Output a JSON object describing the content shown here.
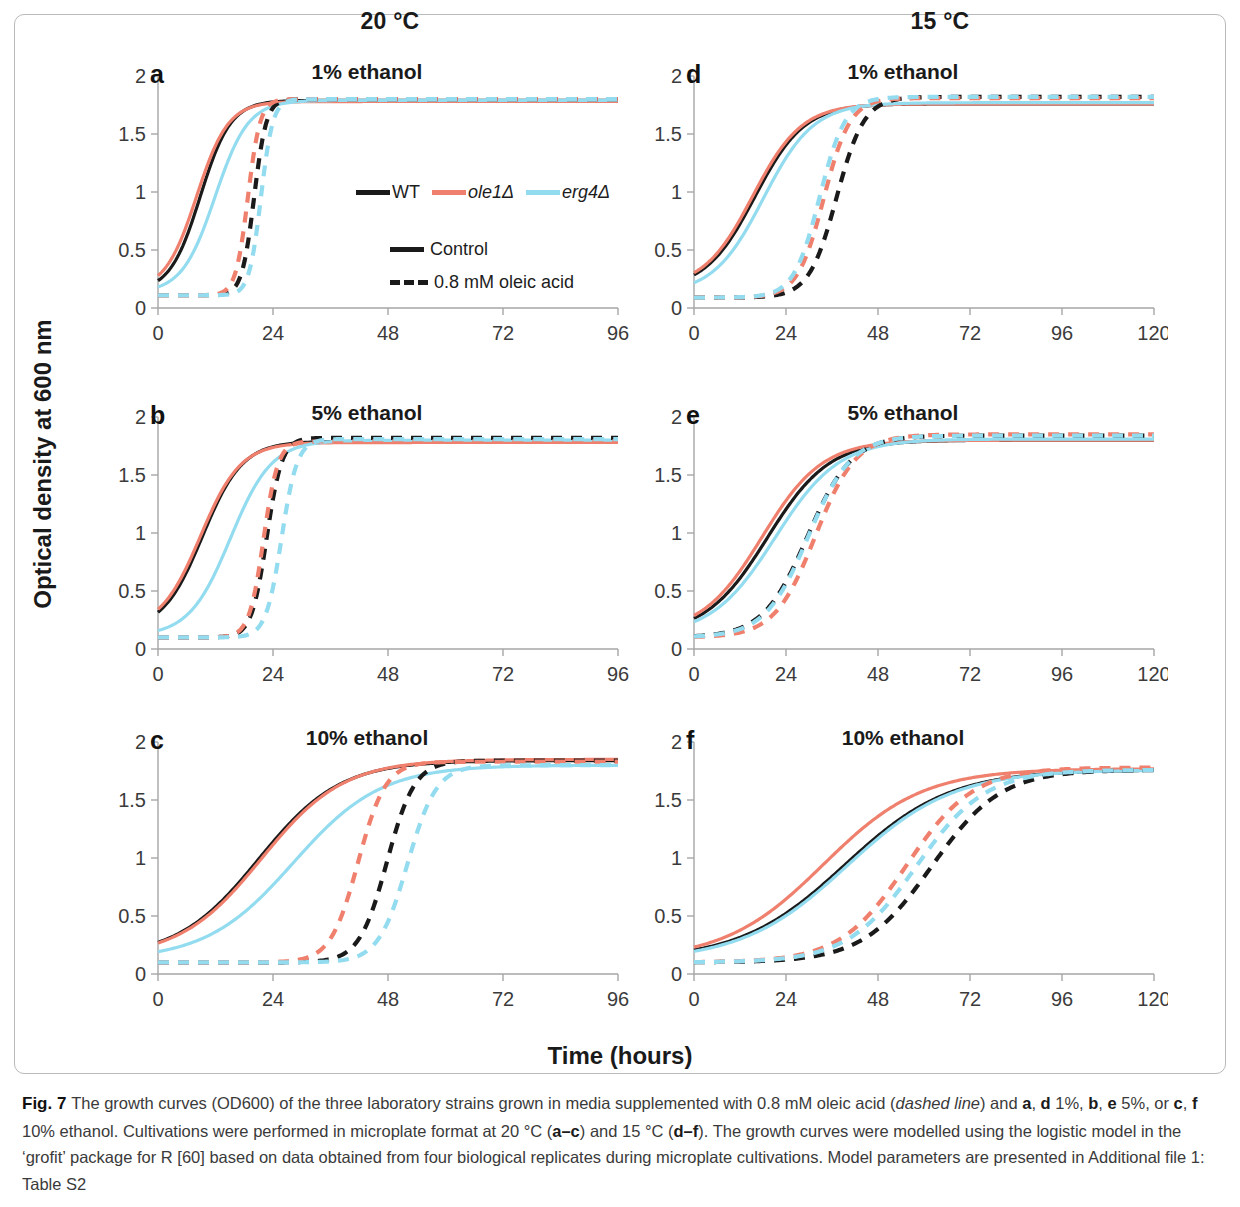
{
  "figure": {
    "number_label": "Fig. 7",
    "columns": [
      {
        "id": "col-20",
        "temperature": "20 °C"
      },
      {
        "id": "col-15",
        "temperature": "15 °C"
      }
    ],
    "axis_titles": {
      "y": "Optical density at 600 nm",
      "x": "Time (hours)"
    }
  },
  "legend": {
    "strains": [
      {
        "name": "WT",
        "color": "#1a1a1a",
        "italic": false
      },
      {
        "name": "ole1Δ",
        "color": "#f0806e",
        "italic": true
      },
      {
        "name": "erg4Δ",
        "color": "#93dcf0",
        "italic": true
      }
    ],
    "styles": [
      {
        "label": "Control",
        "dash": false
      },
      {
        "label": "0.8 mM oleic acid",
        "dash": true
      }
    ]
  },
  "caption": {
    "prefix": "Fig. 7",
    "text_parts": [
      {
        "t": "The growth curves (OD600) of the three laboratory strains grown in media supplemented with 0.8 mM oleic acid (",
        "style": "normal"
      },
      {
        "t": "dashed line",
        "style": "italic"
      },
      {
        "t": ") and ",
        "style": "normal"
      },
      {
        "t": "a",
        "style": "bold"
      },
      {
        "t": ", ",
        "style": "normal"
      },
      {
        "t": "d",
        "style": "bold"
      },
      {
        "t": " 1%, ",
        "style": "normal"
      },
      {
        "t": "b",
        "style": "bold"
      },
      {
        "t": ", ",
        "style": "normal"
      },
      {
        "t": "e",
        "style": "bold"
      },
      {
        "t": " 5%, or ",
        "style": "normal"
      },
      {
        "t": "c",
        "style": "bold"
      },
      {
        "t": ", ",
        "style": "normal"
      },
      {
        "t": "f",
        "style": "bold"
      },
      {
        "t": " 10% ethanol. Cultivations were performed in microplate format at 20 °C (",
        "style": "normal"
      },
      {
        "t": "a–c",
        "style": "bold"
      },
      {
        "t": ") and 15 °C (",
        "style": "normal"
      },
      {
        "t": "d–f",
        "style": "bold"
      },
      {
        "t": "). The growth curves were modelled using the logistic model in the ‘grofit’ package for R [60] based on data obtained from four biological replicates during microplate cultivations. Model parameters are presented in Additional file 1: Table S2",
        "style": "normal"
      }
    ]
  },
  "chart_data": {
    "type": "line",
    "xlabel": "Time (hours)",
    "ylabel": "Optical density at 600 nm",
    "ylim": [
      0,
      2
    ],
    "yticks": [
      0,
      0.5,
      1,
      1.5,
      2
    ],
    "ytick_labels": [
      "0",
      "0.5",
      "1",
      "1.5",
      "2"
    ],
    "grid": false,
    "legend_position": "inside-panel-a",
    "model": "logistic: y = y0 + (A - y0) / (1 + exp(4*mu/(A-y0)*(lambda - t) + 2))",
    "panels": [
      {
        "letter": "a",
        "title": "1% ethanol",
        "temperature": "20 °C",
        "ethanol": "1%",
        "xlim": [
          0,
          96
        ],
        "xticks": [
          0,
          24,
          48,
          72,
          96
        ],
        "xtick_labels": [
          "0",
          "24",
          "48",
          "72",
          "96"
        ],
        "series": [
          {
            "name": "WT Control",
            "strain": "WT",
            "treatment": "Control",
            "color": "#1a1a1a",
            "dash": false,
            "y0": 0.14,
            "A": 1.79,
            "mu": 0.13,
            "lambda": 2.5
          },
          {
            "name": "ole1Δ Control",
            "strain": "ole1Δ",
            "treatment": "Control",
            "color": "#f0806e",
            "dash": false,
            "y0": 0.15,
            "A": 1.78,
            "mu": 0.124,
            "lambda": 1.5
          },
          {
            "name": "erg4Δ Control",
            "strain": "erg4Δ",
            "treatment": "Control",
            "color": "#93dcf0",
            "dash": false,
            "y0": 0.13,
            "A": 1.79,
            "mu": 0.12,
            "lambda": 5.0
          },
          {
            "name": "WT 0.8 mM oleic acid",
            "strain": "WT",
            "treatment": "0.8 mM oleic acid",
            "color": "#1a1a1a",
            "dash": true,
            "y0": 0.11,
            "A": 1.8,
            "mu": 0.33,
            "lambda": 17.5
          },
          {
            "name": "ole1Δ 0.8 mM oleic acid",
            "strain": "ole1Δ",
            "treatment": "0.8 mM oleic acid",
            "color": "#f0806e",
            "dash": true,
            "y0": 0.11,
            "A": 1.8,
            "mu": 0.33,
            "lambda": 16.2
          },
          {
            "name": "erg4Δ 0.8 mM oleic acid",
            "strain": "erg4Δ",
            "treatment": "0.8 mM oleic acid",
            "color": "#93dcf0",
            "dash": true,
            "y0": 0.11,
            "A": 1.8,
            "mu": 0.34,
            "lambda": 19.0
          }
        ]
      },
      {
        "letter": "b",
        "title": "5% ethanol",
        "temperature": "20 °C",
        "ethanol": "5%",
        "xlim": [
          0,
          96
        ],
        "xticks": [
          0,
          24,
          48,
          72,
          96
        ],
        "xtick_labels": [
          "0",
          "24",
          "48",
          "72",
          "96"
        ],
        "series": [
          {
            "name": "WT Control",
            "strain": "WT",
            "treatment": "Control",
            "color": "#1a1a1a",
            "dash": false,
            "y0": 0.16,
            "A": 1.79,
            "mu": 0.098,
            "lambda": 1.0
          },
          {
            "name": "ole1Δ Control",
            "strain": "ole1Δ",
            "treatment": "Control",
            "color": "#f0806e",
            "dash": false,
            "y0": 0.17,
            "A": 1.78,
            "mu": 0.096,
            "lambda": 0.5
          },
          {
            "name": "erg4Δ Control",
            "strain": "erg4Δ",
            "treatment": "Control",
            "color": "#93dcf0",
            "dash": false,
            "y0": 0.11,
            "A": 1.8,
            "mu": 0.098,
            "lambda": 6.5
          },
          {
            "name": "WT 0.8 mM oleic acid",
            "strain": "WT",
            "treatment": "0.8 mM oleic acid",
            "color": "#1a1a1a",
            "dash": true,
            "y0": 0.1,
            "A": 1.82,
            "mu": 0.27,
            "lambda": 19.5
          },
          {
            "name": "ole1Δ 0.8 mM oleic acid",
            "strain": "ole1Δ",
            "treatment": "0.8 mM oleic acid",
            "color": "#f0806e",
            "dash": true,
            "y0": 0.1,
            "A": 1.79,
            "mu": 0.28,
            "lambda": 19.0
          },
          {
            "name": "erg4Δ 0.8 mM oleic acid",
            "strain": "erg4Δ",
            "treatment": "0.8 mM oleic acid",
            "color": "#93dcf0",
            "dash": true,
            "y0": 0.1,
            "A": 1.81,
            "mu": 0.26,
            "lambda": 22.5
          }
        ]
      },
      {
        "letter": "c",
        "title": "10% ethanol",
        "temperature": "20 °C",
        "ethanol": "10%",
        "xlim": [
          0,
          96
        ],
        "xticks": [
          0,
          24,
          48,
          72,
          96
        ],
        "xtick_labels": [
          "0",
          "24",
          "48",
          "72",
          "96"
        ],
        "series": [
          {
            "name": "WT Control",
            "strain": "WT",
            "treatment": "Control",
            "color": "#1a1a1a",
            "dash": false,
            "y0": 0.14,
            "A": 1.84,
            "mu": 0.05,
            "lambda": 4.0
          },
          {
            "name": "ole1Δ Control",
            "strain": "ole1Δ",
            "treatment": "Control",
            "color": "#f0806e",
            "dash": false,
            "y0": 0.14,
            "A": 1.85,
            "mu": 0.05,
            "lambda": 4.5
          },
          {
            "name": "erg4Δ Control",
            "strain": "erg4Δ",
            "treatment": "Control",
            "color": "#93dcf0",
            "dash": false,
            "y0": 0.12,
            "A": 1.8,
            "mu": 0.046,
            "lambda": 10.0
          },
          {
            "name": "WT 0.8 mM oleic acid",
            "strain": "WT",
            "treatment": "0.8 mM oleic acid",
            "color": "#1a1a1a",
            "dash": true,
            "y0": 0.1,
            "A": 1.84,
            "mu": 0.15,
            "lambda": 42.0
          },
          {
            "name": "ole1Δ 0.8 mM oleic acid",
            "strain": "ole1Δ",
            "treatment": "0.8 mM oleic acid",
            "color": "#f0806e",
            "dash": true,
            "y0": 0.1,
            "A": 1.83,
            "mu": 0.15,
            "lambda": 36.0
          },
          {
            "name": "erg4Δ 0.8 mM oleic acid",
            "strain": "erg4Δ",
            "treatment": "0.8 mM oleic acid",
            "color": "#93dcf0",
            "dash": true,
            "y0": 0.1,
            "A": 1.8,
            "mu": 0.14,
            "lambda": 46.0
          }
        ]
      },
      {
        "letter": "d",
        "title": "1% ethanol",
        "temperature": "15 °C",
        "ethanol": "1%",
        "xlim": [
          0,
          120
        ],
        "xticks": [
          0,
          24,
          48,
          72,
          96,
          120
        ],
        "xtick_labels": [
          "0",
          "24",
          "48",
          "72",
          "96",
          "120"
        ],
        "series": [
          {
            "name": "WT Control",
            "strain": "WT",
            "treatment": "Control",
            "color": "#1a1a1a",
            "dash": false,
            "y0": 0.16,
            "A": 1.76,
            "mu": 0.062,
            "lambda": 3.0
          },
          {
            "name": "ole1Δ Control",
            "strain": "ole1Δ",
            "treatment": "Control",
            "color": "#f0806e",
            "dash": false,
            "y0": 0.17,
            "A": 1.76,
            "mu": 0.062,
            "lambda": 2.5
          },
          {
            "name": "erg4Δ Control",
            "strain": "erg4Δ",
            "treatment": "Control",
            "color": "#93dcf0",
            "dash": false,
            "y0": 0.12,
            "A": 1.77,
            "mu": 0.063,
            "lambda": 5.0
          },
          {
            "name": "WT 0.8 mM oleic acid",
            "strain": "WT",
            "treatment": "0.8 mM oleic acid",
            "color": "#1a1a1a",
            "dash": true,
            "y0": 0.09,
            "A": 1.82,
            "mu": 0.12,
            "lambda": 30.0
          },
          {
            "name": "ole1Δ 0.8 mM oleic acid",
            "strain": "ole1Δ",
            "treatment": "0.8 mM oleic acid",
            "color": "#f0806e",
            "dash": true,
            "y0": 0.09,
            "A": 1.81,
            "mu": 0.125,
            "lambda": 27.0
          },
          {
            "name": "erg4Δ 0.8 mM oleic acid",
            "strain": "erg4Δ",
            "treatment": "0.8 mM oleic acid",
            "color": "#93dcf0",
            "dash": true,
            "y0": 0.09,
            "A": 1.82,
            "mu": 0.128,
            "lambda": 26.0
          }
        ]
      },
      {
        "letter": "e",
        "title": "5% ethanol",
        "temperature": "15 °C",
        "ethanol": "5%",
        "xlim": [
          0,
          120
        ],
        "xticks": [
          0,
          24,
          48,
          72,
          96,
          120
        ],
        "xtick_labels": [
          "0",
          "24",
          "48",
          "72",
          "96",
          "120"
        ],
        "series": [
          {
            "name": "WT Control",
            "strain": "WT",
            "treatment": "Control",
            "color": "#1a1a1a",
            "dash": false,
            "y0": 0.12,
            "A": 1.8,
            "mu": 0.052,
            "lambda": 3.0
          },
          {
            "name": "ole1Δ Control",
            "strain": "ole1Δ",
            "treatment": "Control",
            "color": "#f0806e",
            "dash": false,
            "y0": 0.13,
            "A": 1.8,
            "mu": 0.053,
            "lambda": 2.0
          },
          {
            "name": "erg4Δ Control",
            "strain": "erg4Δ",
            "treatment": "Control",
            "color": "#93dcf0",
            "dash": false,
            "y0": 0.11,
            "A": 1.81,
            "mu": 0.051,
            "lambda": 4.5
          },
          {
            "name": "WT 0.8 mM oleic acid",
            "strain": "WT",
            "treatment": "0.8 mM oleic acid",
            "color": "#1a1a1a",
            "dash": true,
            "y0": 0.1,
            "A": 1.84,
            "mu": 0.075,
            "lambda": 18.0
          },
          {
            "name": "ole1Δ 0.8 mM oleic acid",
            "strain": "ole1Δ",
            "treatment": "0.8 mM oleic acid",
            "color": "#f0806e",
            "dash": true,
            "y0": 0.1,
            "A": 1.85,
            "mu": 0.082,
            "lambda": 21.0
          },
          {
            "name": "erg4Δ 0.8 mM oleic acid",
            "strain": "erg4Δ",
            "treatment": "0.8 mM oleic acid",
            "color": "#93dcf0",
            "dash": true,
            "y0": 0.1,
            "A": 1.84,
            "mu": 0.077,
            "lambda": 18.5
          }
        ]
      },
      {
        "letter": "f",
        "title": "10% ethanol",
        "temperature": "15 °C",
        "ethanol": "10%",
        "xlim": [
          0,
          120
        ],
        "xticks": [
          0,
          24,
          48,
          72,
          96,
          120
        ],
        "xtick_labels": [
          "0",
          "24",
          "48",
          "72",
          "96",
          "120"
        ],
        "series": [
          {
            "name": "WT Control",
            "strain": "WT",
            "treatment": "Control",
            "color": "#1a1a1a",
            "dash": false,
            "y0": 0.12,
            "A": 1.76,
            "mu": 0.03,
            "lambda": 12.0
          },
          {
            "name": "ole1Δ Control",
            "strain": "ole1Δ",
            "treatment": "Control",
            "color": "#f0806e",
            "dash": false,
            "y0": 0.12,
            "A": 1.77,
            "mu": 0.032,
            "lambda": 8.0
          },
          {
            "name": "erg4Δ Control",
            "strain": "erg4Δ",
            "treatment": "Control",
            "color": "#93dcf0",
            "dash": false,
            "y0": 0.11,
            "A": 1.76,
            "mu": 0.03,
            "lambda": 12.5
          },
          {
            "name": "WT 0.8 mM oleic acid",
            "strain": "WT",
            "treatment": "0.8 mM oleic acid",
            "color": "#1a1a1a",
            "dash": true,
            "y0": 0.1,
            "A": 1.76,
            "mu": 0.046,
            "lambda": 44.0
          },
          {
            "name": "ole1Δ 0.8 mM oleic acid",
            "strain": "ole1Δ",
            "treatment": "0.8 mM oleic acid",
            "color": "#f0806e",
            "dash": true,
            "y0": 0.1,
            "A": 1.78,
            "mu": 0.048,
            "lambda": 38.0
          },
          {
            "name": "erg4Δ 0.8 mM oleic acid",
            "strain": "erg4Δ",
            "treatment": "0.8 mM oleic acid",
            "color": "#93dcf0",
            "dash": true,
            "y0": 0.1,
            "A": 1.76,
            "mu": 0.046,
            "lambda": 40.0
          }
        ]
      }
    ]
  }
}
